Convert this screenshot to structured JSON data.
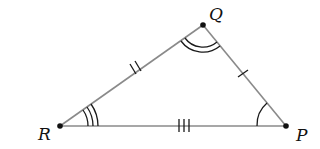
{
  "diagram": {
    "type": "triangle",
    "colors": {
      "sides": "#8a8a8a",
      "marks": "#1a1a1a",
      "vertices": "#111111",
      "background": "#ffffff"
    },
    "vertices": [
      {
        "name": "Q",
        "label": "Q",
        "x": 203,
        "y": 25
      },
      {
        "name": "R",
        "label": "R",
        "x": 60,
        "y": 126
      },
      {
        "name": "P",
        "label": "P",
        "x": 286,
        "y": 126
      }
    ],
    "sides": [
      {
        "from": "R",
        "to": "Q",
        "tick_marks": 2
      },
      {
        "from": "Q",
        "to": "P",
        "tick_marks": 1
      },
      {
        "from": "R",
        "to": "P",
        "tick_marks": 3
      }
    ],
    "angles": [
      {
        "vertex": "R",
        "arcs": 3
      },
      {
        "vertex": "Q",
        "arcs": 2
      },
      {
        "vertex": "P",
        "arcs": 1
      }
    ]
  }
}
